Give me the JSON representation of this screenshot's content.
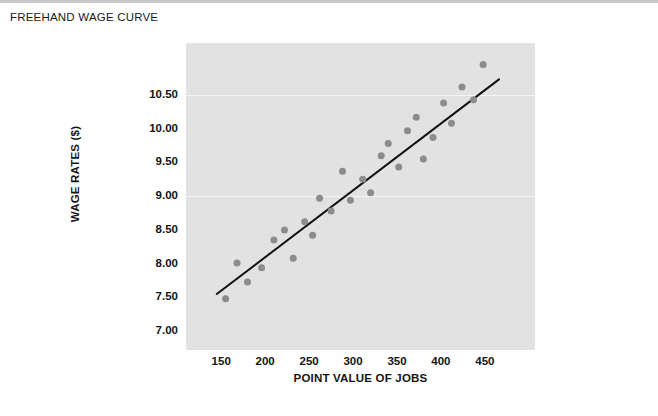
{
  "page": {
    "title": "FREEHAND WAGE CURVE",
    "background_color": "#ffffff",
    "rule_color": "#c8c8c8"
  },
  "chart_data": {
    "type": "scatter",
    "title": "FREEHAND WAGE CURVE",
    "xlabel": "POINT VALUE OF JOBS",
    "ylabel": "WAGE RATES ($)",
    "xlim": [
      110,
      507
    ],
    "ylim": [
      6.72,
      11.27
    ],
    "xticks": [
      150,
      200,
      250,
      300,
      350,
      400,
      450
    ],
    "xtick_labels": [
      "150",
      "200",
      "250",
      "300",
      "350",
      "400",
      "450"
    ],
    "yticks": [
      7.0,
      7.5,
      8.0,
      8.5,
      9.0,
      9.5,
      10.0,
      10.5
    ],
    "ytick_labels": [
      "7.00",
      "7.50",
      "8.00",
      "8.50",
      "9.00",
      "9.50",
      "10.00",
      "10.50"
    ],
    "grid": false,
    "gridline_values": [
      10.5,
      9.0
    ],
    "legend": null,
    "plot_background": "#e2e2e2",
    "marker_color": "#8c8c8c",
    "marker_size": 7,
    "points": [
      {
        "x": 155,
        "y": 7.48
      },
      {
        "x": 168,
        "y": 8.01
      },
      {
        "x": 180,
        "y": 7.73
      },
      {
        "x": 196,
        "y": 7.94
      },
      {
        "x": 210,
        "y": 8.35
      },
      {
        "x": 222,
        "y": 8.5
      },
      {
        "x": 232,
        "y": 8.08
      },
      {
        "x": 245,
        "y": 8.62
      },
      {
        "x": 254,
        "y": 8.42
      },
      {
        "x": 262,
        "y": 8.97
      },
      {
        "x": 275,
        "y": 8.78
      },
      {
        "x": 288,
        "y": 9.37
      },
      {
        "x": 297,
        "y": 8.94
      },
      {
        "x": 311,
        "y": 9.25
      },
      {
        "x": 320,
        "y": 9.05
      },
      {
        "x": 332,
        "y": 9.6
      },
      {
        "x": 340,
        "y": 9.78
      },
      {
        "x": 352,
        "y": 9.43
      },
      {
        "x": 362,
        "y": 9.97
      },
      {
        "x": 372,
        "y": 10.17
      },
      {
        "x": 380,
        "y": 9.55
      },
      {
        "x": 391,
        "y": 9.87
      },
      {
        "x": 403,
        "y": 10.38
      },
      {
        "x": 412,
        "y": 10.08
      },
      {
        "x": 424,
        "y": 10.62
      },
      {
        "x": 437,
        "y": 10.43
      },
      {
        "x": 448,
        "y": 10.95
      }
    ],
    "trendline": {
      "style": "freehand",
      "color": "#111111",
      "width": 2,
      "start": {
        "x": 145,
        "y": 7.55
      },
      "end": {
        "x": 466,
        "y": 10.73
      }
    }
  }
}
